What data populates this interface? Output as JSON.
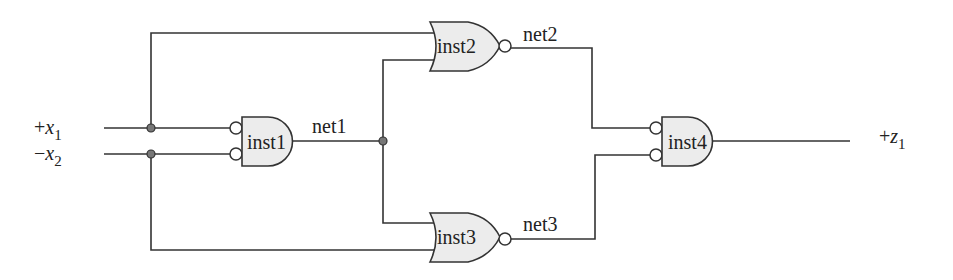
{
  "diagram": {
    "type": "logic-circuit",
    "inputs": [
      {
        "id": "x1",
        "sign": "+",
        "var": "x",
        "sub": "1"
      },
      {
        "id": "x2",
        "sign": "−",
        "var": "x",
        "sub": "2"
      }
    ],
    "outputs": [
      {
        "id": "z1",
        "sign": "+",
        "var": "z",
        "sub": "1"
      }
    ],
    "gates": [
      {
        "id": "inst1",
        "label": "inst1",
        "kind": "AND",
        "inverted_inputs": 2,
        "output_inverted": false
      },
      {
        "id": "inst2",
        "label": "inst2",
        "kind": "NOR",
        "inverted_inputs": 0,
        "output_inverted": true
      },
      {
        "id": "inst3",
        "label": "inst3",
        "kind": "NOR",
        "inverted_inputs": 0,
        "output_inverted": true
      },
      {
        "id": "inst4",
        "label": "inst4",
        "kind": "AND",
        "inverted_inputs": 2,
        "output_inverted": false
      }
    ],
    "nets": [
      {
        "id": "net1",
        "label": "net1"
      },
      {
        "id": "net2",
        "label": "net2"
      },
      {
        "id": "net3",
        "label": "net3"
      }
    ],
    "colors": {
      "wire": "#333333",
      "gate_fill": "#ececec",
      "junction_dot": "#777777",
      "background": "#ffffff"
    }
  }
}
